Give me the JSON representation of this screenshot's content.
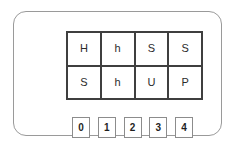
{
  "panel": {
    "border_color": "#9a9a9a",
    "background_color": "#ffffff"
  },
  "letter_grid": {
    "columns": 4,
    "rows": 2,
    "border_color": "#3f3f3f",
    "cells": [
      {
        "label": "H"
      },
      {
        "label": "h"
      },
      {
        "label": "S"
      },
      {
        "label": "S"
      },
      {
        "label": "S"
      },
      {
        "label": "h"
      },
      {
        "label": "U"
      },
      {
        "label": "P"
      }
    ]
  },
  "number_row": {
    "border_color": "#8c8c8c",
    "boxes": [
      {
        "label": "0"
      },
      {
        "label": "1"
      },
      {
        "label": "2"
      },
      {
        "label": "3"
      },
      {
        "label": "4"
      }
    ]
  }
}
